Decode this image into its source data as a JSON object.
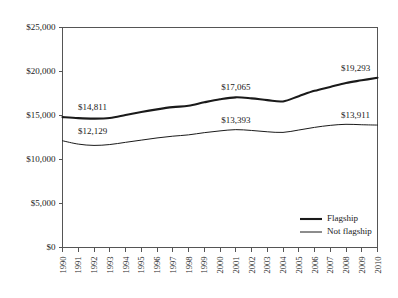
{
  "chart_data": {
    "type": "line",
    "title": "",
    "xlabel": "",
    "ylabel": "",
    "grid": false,
    "legend_position": "bottom-right",
    "ylim": [
      0,
      25000
    ],
    "ytick_values": [
      0,
      5000,
      10000,
      15000,
      20000,
      25000
    ],
    "ytick_labels": [
      "$0",
      "$5,000",
      "$10,000",
      "$15,000",
      "$20,000",
      "$25,000"
    ],
    "categories": [
      "1990",
      "1991",
      "1992",
      "1993",
      "1994",
      "1995",
      "1996",
      "1997",
      "1998",
      "1999",
      "2000",
      "2001",
      "2002",
      "2003",
      "2004",
      "2005",
      "2006",
      "2007",
      "2008",
      "2009",
      "2010"
    ],
    "series": [
      {
        "name": "Flagship",
        "values": [
          14811,
          14700,
          14650,
          14720,
          15050,
          15400,
          15700,
          15950,
          16100,
          16500,
          16850,
          17065,
          16950,
          16750,
          16600,
          17200,
          17800,
          18250,
          18700,
          19000,
          19293
        ]
      },
      {
        "name": "Not flagship",
        "values": [
          12129,
          11750,
          11600,
          11700,
          11950,
          12200,
          12450,
          12650,
          12800,
          13050,
          13250,
          13393,
          13300,
          13150,
          13080,
          13350,
          13650,
          13880,
          14000,
          13950,
          13911
        ]
      }
    ],
    "annotations": [
      {
        "text": "$14,811",
        "series": "Flagship",
        "category": "1990"
      },
      {
        "text": "$17,065",
        "series": "Flagship",
        "category": "2001"
      },
      {
        "text": "$19,293",
        "series": "Flagship",
        "category": "2010"
      },
      {
        "text": "$12,129",
        "series": "Not flagship",
        "category": "1990"
      },
      {
        "text": "$13,393",
        "series": "Not flagship",
        "category": "2001"
      },
      {
        "text": "$13,911",
        "series": "Not flagship",
        "category": "2010"
      }
    ],
    "legend_entries": [
      {
        "label": "Flagship",
        "style": "thick",
        "color": "#1a1a1a"
      },
      {
        "label": "Not flagship",
        "style": "thin",
        "color": "#1a1a1a"
      }
    ],
    "colors": {
      "flagship": "#1a1a1a",
      "not_flagship": "#1a1a1a",
      "axis": "#555555",
      "background": "#ffffff"
    }
  }
}
